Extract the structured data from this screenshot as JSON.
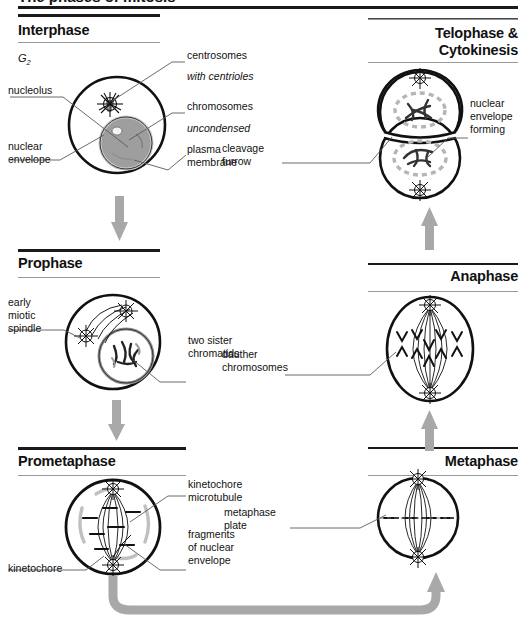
{
  "figure": {
    "title_cutoff": "The phases of mitosis",
    "type": "cell-cycle-diagram"
  },
  "panels": [
    {
      "id": "interphase",
      "heading": "Interphase",
      "align": "left",
      "stage_note": "G2",
      "labels": [
        {
          "name": "nucleolus",
          "text": "nucleolus",
          "align": "left",
          "italic": false
        },
        {
          "name": "nuclear-envelope",
          "text": "nuclear\nenvelope",
          "align": "left",
          "italic": false
        },
        {
          "name": "centrosomes",
          "text": "centrosomes",
          "align": "left",
          "italic": false
        },
        {
          "name": "with-centrioles",
          "text": "with centrioles",
          "align": "left",
          "italic": true
        },
        {
          "name": "chromosomes",
          "text": "chromosomes",
          "align": "left",
          "italic": false
        },
        {
          "name": "uncondensed",
          "text": "uncondensed",
          "align": "left",
          "italic": true
        },
        {
          "name": "plasma-membrane",
          "text": "plasma\nmembrane",
          "align": "right",
          "italic": false
        }
      ]
    },
    {
      "id": "telophase",
      "heading": "Telophase &\nCytokinesis",
      "align": "right",
      "labels": [
        {
          "name": "cleavage-furrow",
          "text": "cleavage\nfurrow",
          "align": "left",
          "italic": false
        },
        {
          "name": "nuclear-envelope-forming",
          "text": "nuclear\nenvelope\nforming",
          "align": "right",
          "italic": false
        }
      ]
    },
    {
      "id": "prophase",
      "heading": "Prophase",
      "align": "left",
      "labels": [
        {
          "name": "early-miotic-spindle",
          "text": "early\nmiotic\nspindle",
          "align": "left",
          "italic": false
        },
        {
          "name": "two-sister-chromatids",
          "text": "two sister\nchromatids",
          "align": "left",
          "italic": false
        }
      ]
    },
    {
      "id": "anaphase",
      "heading": "Anaphase",
      "align": "right",
      "labels": [
        {
          "name": "dauther-chromosomes",
          "text": "dauther\nchromosomes",
          "align": "left",
          "italic": false
        }
      ]
    },
    {
      "id": "prometaphase",
      "heading": "Prometaphase",
      "align": "left",
      "labels": [
        {
          "name": "kinetochore-microtubule",
          "text": "kinetochore\nmicrotubule",
          "align": "left",
          "italic": false
        },
        {
          "name": "fragments-of-nuclear-envelope",
          "text": "fragments\nof nuclear\nenvelope",
          "align": "right",
          "italic": false
        },
        {
          "name": "kinetochore",
          "text": "kinetochore",
          "align": "left",
          "italic": false
        }
      ]
    },
    {
      "id": "metaphase",
      "heading": "Metaphase",
      "align": "right",
      "labels": [
        {
          "name": "metaphase-plate",
          "text": "metaphase\nplate",
          "align": "left",
          "italic": false
        }
      ]
    }
  ],
  "flow": {
    "arrows": [
      {
        "name": "arrow-interphase-to-prophase",
        "direction": "down"
      },
      {
        "name": "arrow-prophase-to-prometaphase",
        "direction": "down"
      },
      {
        "name": "arrow-prometaphase-to-metaphase",
        "direction": "curved-right-up"
      },
      {
        "name": "arrow-metaphase-to-anaphase",
        "direction": "up"
      },
      {
        "name": "arrow-anaphase-to-telophase",
        "direction": "up"
      }
    ]
  },
  "colors": {
    "ink": "#111111",
    "rule_dark": "#1a1a1a",
    "rule_light": "#9a9a9a",
    "arrow_gray": "#a8a8a8",
    "nucleus_fill": "#9e9e9e",
    "envelope_gray": "#b5b5b5",
    "leader": "#5a5a5a"
  }
}
